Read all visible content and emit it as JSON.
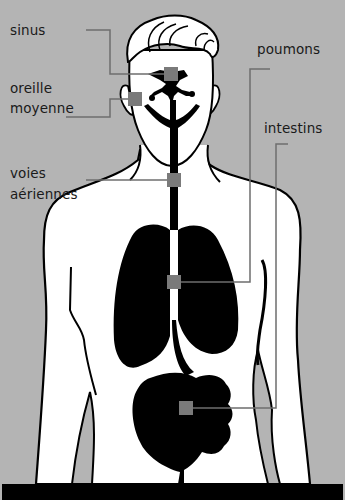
{
  "diagram": {
    "type": "anatomical-illustration",
    "colors": {
      "background": "#b4b4b4",
      "body_fill": "#ffffff",
      "organ_fill": "#000000",
      "marker_fill": "#7a7a7a",
      "leader_line": "#6e6e6e",
      "label_text": "#1a1a1a"
    },
    "labels": {
      "sinus": "sinus",
      "oreille_line1": "oreille",
      "oreille_line2": "moyenne",
      "voies_line1": "voies",
      "voies_line2": "aériennes",
      "poumons": "poumons",
      "intestins": "intestins"
    },
    "markers": [
      {
        "id": "sinus",
        "x": 170,
        "y": 74
      },
      {
        "id": "oreille-moyenne",
        "x": 135,
        "y": 99
      },
      {
        "id": "voies-aeriennes",
        "x": 174,
        "y": 180
      },
      {
        "id": "poumons",
        "x": 174,
        "y": 282
      },
      {
        "id": "intestins",
        "x": 186,
        "y": 408
      }
    ]
  }
}
